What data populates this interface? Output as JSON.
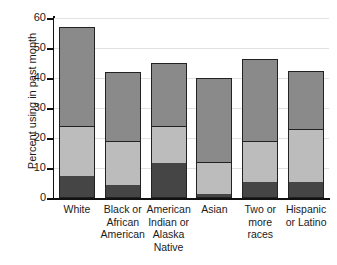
{
  "chart_data": {
    "type": "bar",
    "title": "",
    "subtitle": "",
    "xlabel": "",
    "ylabel": "Percent using in past month",
    "ylim": [
      0,
      60
    ],
    "yticks": [
      0,
      10,
      20,
      30,
      40,
      50,
      60
    ],
    "ytick_labels": [
      "0",
      "10",
      "20",
      "30",
      "40",
      "50",
      "60"
    ],
    "grid": true,
    "legend": "none",
    "stacked": true,
    "categories": [
      "White",
      "Black or African American",
      "American Indian or Alaska Native",
      "Asian",
      "Two or more races",
      "Hispanic or Latino"
    ],
    "category_lines": [
      [
        "White"
      ],
      [
        "Black or",
        "African",
        "American"
      ],
      [
        "American",
        "Indian or",
        "Alaska",
        "Native"
      ],
      [
        "Asian"
      ],
      [
        "Two or",
        "more",
        "races"
      ],
      [
        "Hispanic",
        "or Latino"
      ]
    ],
    "series": [
      {
        "name": "bottom-segment",
        "color": "#454545",
        "values": [
          7,
          4,
          11.5,
          1,
          5,
          5
        ]
      },
      {
        "name": "middle-segment",
        "color": "#bcbcbc",
        "values": [
          17,
          15,
          12.5,
          11,
          14,
          18
        ]
      },
      {
        "name": "top-segment",
        "color": "#8a8a8a",
        "values": [
          33,
          23,
          21,
          28,
          27.5,
          19.5
        ]
      }
    ],
    "cumulative_tops": [
      [
        7,
        24,
        57
      ],
      [
        4,
        19,
        42
      ],
      [
        11.5,
        24,
        45
      ],
      [
        1,
        12,
        40
      ],
      [
        5,
        19,
        46.5
      ],
      [
        5,
        23,
        42.5
      ]
    ],
    "totals": [
      57,
      42,
      45,
      40,
      46.5,
      42.5
    ]
  },
  "colors": {
    "bottom": "#454545",
    "middle": "#bcbcbc",
    "top": "#8a8a8a",
    "outline": "#222222",
    "grid": "#e2e2e2",
    "axis": "#111111",
    "background": "#ffffff",
    "text": "#1a1a1a"
  }
}
